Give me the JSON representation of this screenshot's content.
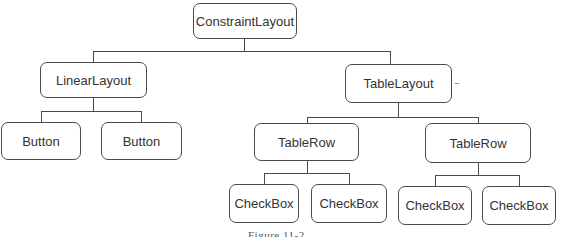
{
  "diagram": {
    "type": "tree",
    "root": {
      "label": "ConstraintLayout",
      "children": [
        {
          "label": "LinearLayout",
          "children": [
            {
              "label": "Button"
            },
            {
              "label": "Button"
            }
          ]
        },
        {
          "label": "TableLayout",
          "children": [
            {
              "label": "TableRow",
              "children": [
                {
                  "label": "CheckBox"
                },
                {
                  "label": "CheckBox"
                }
              ]
            },
            {
              "label": "TableRow",
              "children": [
                {
                  "label": "CheckBox"
                },
                {
                  "label": "CheckBox"
                }
              ]
            }
          ]
        }
      ]
    },
    "caption": "Figure 11-2"
  },
  "colors": {
    "line": "#4a4a4a",
    "background": "#ffffff"
  }
}
